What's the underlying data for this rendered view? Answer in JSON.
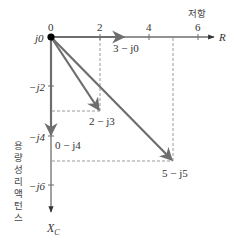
{
  "colors": {
    "axis": "#6e6e6e",
    "vector": "#6e6e6e",
    "dashed": "#9a9a9a",
    "origin_dot": "#000000",
    "text": "#333333"
  },
  "axes": {
    "x_axis_label": "R",
    "x_axis_title": "저항",
    "y_axis_label": "X",
    "y_axis_label_sub": "C",
    "y_axis_title": "용량성 리액턴스",
    "x_ticks": [
      "0",
      "2",
      "4",
      "6"
    ],
    "y_ticks": [
      "j0",
      "−j2",
      "−j4",
      "−j6"
    ]
  },
  "vectors": [
    {
      "label": "3 − j0",
      "r": 3,
      "x": 0
    },
    {
      "label": "2 − j3",
      "r": 2,
      "x": -3
    },
    {
      "label": "0 − j4",
      "r": 0,
      "x": -4
    },
    {
      "label": "5 − j5",
      "r": 5,
      "x": -5
    }
  ]
}
